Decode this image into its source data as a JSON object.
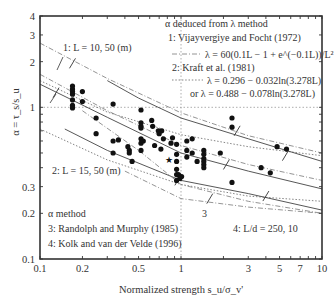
{
  "chart_data": {
    "type": "scatter",
    "title": "",
    "xlabel": "Normalized strength s_u/σ_v'",
    "ylabel": "α = τ_s/s_u",
    "xscale": "log",
    "yscale": "log",
    "xlim": [
      0.1,
      10
    ],
    "ylim": [
      0.1,
      4
    ],
    "x_ticks": [
      0.1,
      0.2,
      0.5,
      1,
      3,
      5,
      7,
      10
    ],
    "x_tick_labels": [
      "0.1",
      "0.2",
      "0.5",
      "1",
      "3",
      "5",
      "7",
      "10"
    ],
    "y_ticks": [
      0.1,
      0.2,
      0.3,
      1,
      2,
      3,
      4
    ],
    "y_tick_labels": [
      "0.1",
      "0.2",
      "0.3",
      "1",
      "2",
      "3",
      "4"
    ],
    "reference_lines": {
      "x": 1,
      "y": 1,
      "style": "dotted"
    },
    "grid": false,
    "annotations": [
      {
        "id": "legend-lambda-header",
        "text": "α deduced from λ method"
      },
      {
        "id": "legend-1",
        "text": "1: Vijayvergiye and Focht (1972)"
      },
      {
        "id": "legend-1-eq",
        "text": "λ = 60(0.1L − 1 + e^(−0.1L))/L²"
      },
      {
        "id": "legend-2",
        "text": "2: Kraft et al. (1981)"
      },
      {
        "id": "legend-2-eq-a",
        "text": "λ = 0.296 − 0.032ln(3.278L)"
      },
      {
        "id": "legend-2-eq-b",
        "text": "or λ = 0.488 − 0.078ln(3.278L)"
      },
      {
        "id": "label-curve-1",
        "text": "1: L = 10, 50 (m)"
      },
      {
        "id": "label-curve-2",
        "text": "2: L = 15, 50 (m)"
      },
      {
        "id": "legend-alpha-header",
        "text": "α method"
      },
      {
        "id": "legend-3",
        "text": "3: Randolph and Murphy (1985)"
      },
      {
        "id": "legend-4",
        "text": "4: Kolk and van der Velde (1996)"
      },
      {
        "id": "label-curve-3",
        "text": "3"
      },
      {
        "id": "label-curve-4",
        "text": "4: L/d = 250, 10"
      }
    ],
    "series": [
      {
        "name": "Measured data",
        "kind": "scatter",
        "marker": "filled-circle",
        "points": [
          [
            0.17,
            1.38
          ],
          [
            0.17,
            1.32
          ],
          [
            0.17,
            1.27
          ],
          [
            0.17,
            1.22
          ],
          [
            0.17,
            1.12
          ],
          [
            0.17,
            1.03
          ],
          [
            0.17,
            0.99
          ],
          [
            0.2,
            1.27
          ],
          [
            0.2,
            1.09
          ],
          [
            0.25,
            0.85
          ],
          [
            0.25,
            0.67
          ],
          [
            0.33,
            1.05
          ],
          [
            0.33,
            0.6
          ],
          [
            0.33,
            0.5
          ],
          [
            0.36,
            0.61
          ],
          [
            0.42,
            0.55
          ],
          [
            0.43,
            0.52
          ],
          [
            0.43,
            0.5
          ],
          [
            0.45,
            0.44
          ],
          [
            0.52,
            0.96
          ],
          [
            0.52,
            0.79
          ],
          [
            0.52,
            0.75
          ],
          [
            0.52,
            0.73
          ],
          [
            0.52,
            0.62
          ],
          [
            0.52,
            0.58
          ],
          [
            0.52,
            0.52
          ],
          [
            0.54,
            0.6
          ],
          [
            0.62,
            0.82
          ],
          [
            0.63,
            0.75
          ],
          [
            0.69,
            0.7
          ],
          [
            0.7,
            0.67
          ],
          [
            0.75,
            0.62
          ],
          [
            0.72,
            0.53
          ],
          [
            0.73,
            0.7
          ],
          [
            0.65,
            0.56
          ],
          [
            0.85,
            0.58
          ],
          [
            0.87,
            0.63
          ],
          [
            0.93,
            0.57
          ],
          [
            0.93,
            0.49
          ],
          [
            0.93,
            0.44
          ],
          [
            0.93,
            0.39
          ],
          [
            0.93,
            0.36
          ],
          [
            0.93,
            0.33
          ],
          [
            0.96,
            0.36
          ],
          [
            0.98,
            0.34
          ],
          [
            1.01,
            0.35
          ],
          [
            1.1,
            0.6
          ],
          [
            1.1,
            0.52
          ],
          [
            1.1,
            0.47
          ],
          [
            1.2,
            0.62
          ],
          [
            1.2,
            0.5
          ],
          [
            1.3,
            0.44
          ],
          [
            1.45,
            0.52
          ],
          [
            1.45,
            0.49
          ],
          [
            1.45,
            0.46
          ],
          [
            1.45,
            0.44
          ],
          [
            1.45,
            0.42
          ],
          [
            1.45,
            0.4
          ],
          [
            1.9,
            0.5
          ],
          [
            2.3,
            0.85
          ],
          [
            2.3,
            0.74
          ],
          [
            2.3,
            0.32
          ],
          [
            3.7,
            0.4
          ],
          [
            4.3,
            0.37
          ],
          [
            4.8,
            0.55
          ],
          [
            5.6,
            0.53
          ]
        ]
      },
      {
        "name": "Measured data (star)",
        "kind": "scatter",
        "marker": "star",
        "points": [
          [
            0.82,
            0.45
          ]
        ]
      },
      {
        "name": "1: Vijayvergiye and Focht, L = 10 m",
        "kind": "line",
        "style": "dash-dot",
        "x": [
          0.1,
          0.3,
          1,
          3,
          10
        ],
        "y": [
          2.65,
          1.55,
          0.92,
          0.65,
          0.5
        ]
      },
      {
        "name": "1: Vijayvergiye and Focht, L = 50 m",
        "kind": "line",
        "style": "dash-dot",
        "x": [
          0.1,
          0.3,
          1,
          3,
          10
        ],
        "y": [
          1.65,
          0.95,
          0.56,
          0.42,
          0.33
        ]
      },
      {
        "name": "2: Kraft et al., L = 15 m",
        "kind": "line",
        "style": "dotted",
        "x": [
          0.1,
          0.3,
          1,
          3,
          10
        ],
        "y": [
          1.5,
          0.93,
          0.66,
          0.55,
          0.48
        ]
      },
      {
        "name": "2: Kraft et al., L = 50 m",
        "kind": "line",
        "style": "dotted",
        "x": [
          0.1,
          0.3,
          1,
          3,
          10
        ],
        "y": [
          0.72,
          0.45,
          0.31,
          0.26,
          0.24
        ]
      },
      {
        "name": "3: Randolph and Murphy (1985)",
        "kind": "line",
        "style": "solid",
        "x": [
          0.3,
          0.5,
          1,
          3,
          10
        ],
        "y": [
          1.5,
          1.15,
          0.85,
          0.62,
          0.44
        ],
        "x2": [
          0.1,
          0.3,
          1,
          3,
          10
        ],
        "y2": [
          1.42,
          0.86,
          0.5,
          0.38,
          0.29
        ]
      },
      {
        "name": "3: Randolph and Murphy lower",
        "kind": "line",
        "style": "solid",
        "x": [
          0.15,
          0.3,
          1,
          3,
          10
        ],
        "y": [
          0.72,
          0.52,
          0.33,
          0.27,
          0.21
        ]
      },
      {
        "name": "4: Kolk and van der Velde, L/d = 250",
        "kind": "line",
        "style": "dash-dot",
        "x": [
          0.2,
          0.5,
          1,
          3,
          10
        ],
        "y": [
          0.95,
          0.52,
          0.31,
          0.24,
          0.2
        ]
      },
      {
        "name": "4: Kolk and van der Velde, L/d = 10",
        "kind": "line",
        "style": "dash-dot",
        "x": [
          0.4,
          1,
          3,
          10
        ],
        "y": [
          0.38,
          0.25,
          0.22,
          0.2
        ]
      }
    ],
    "legend_position": "in-plot annotations (top-right, bottom-left)"
  }
}
